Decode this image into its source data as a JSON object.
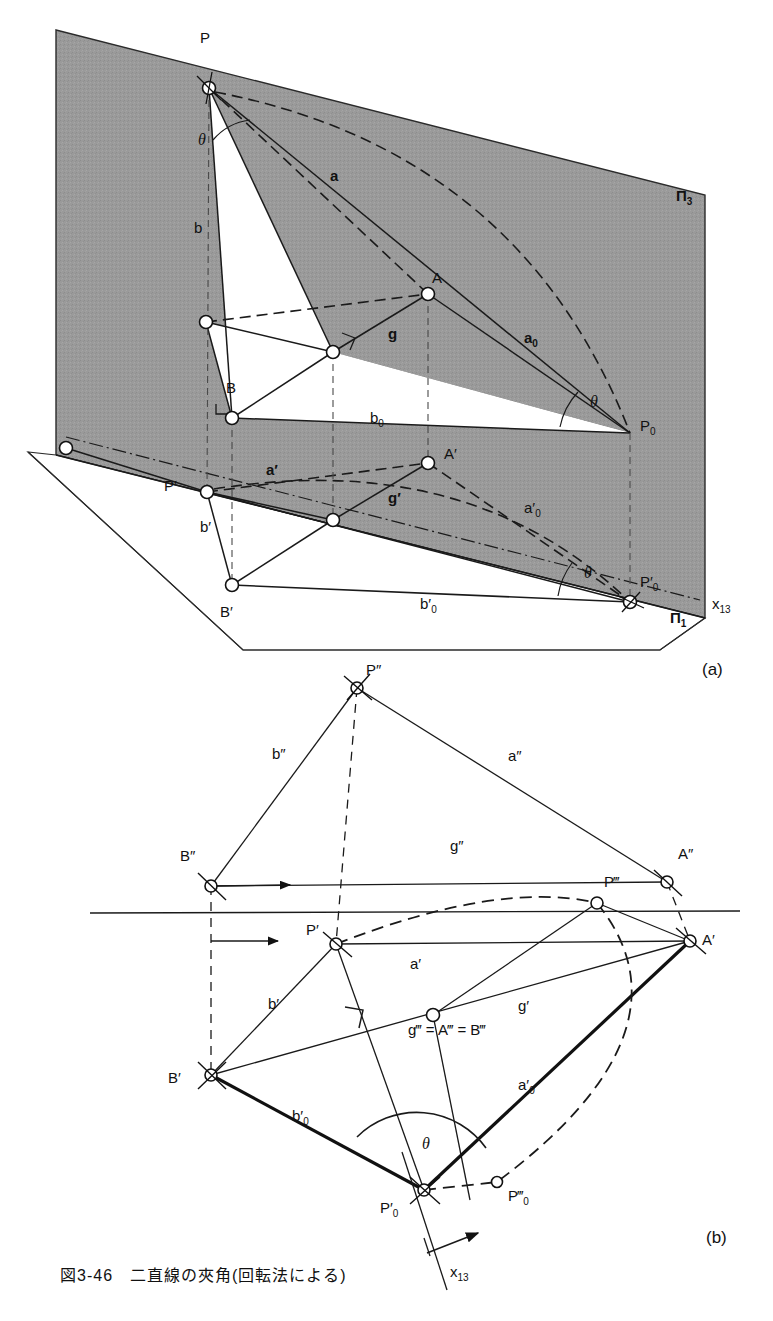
{
  "figure": {
    "caption": "図3-46　二直線の夾角(回転法による)",
    "panel_a_id": "(a)",
    "panel_b_id": "(b)",
    "colors": {
      "plane_fill": "#9a9a9a",
      "line": "#1a1a1a",
      "paper": "#ffffff"
    }
  },
  "panel_a": {
    "name": "pictorial-view",
    "plane_labels": [
      {
        "id": "pi3",
        "text": "Π",
        "sub": "3",
        "x": 678,
        "y": 196
      },
      {
        "id": "pi1",
        "text": "Π",
        "sub": "1",
        "x": 672,
        "y": 618
      },
      {
        "id": "x13",
        "text": "x",
        "sub": "13",
        "x": 714,
        "y": 604
      }
    ],
    "point_labels": [
      {
        "id": "P",
        "text": "P",
        "x": 200,
        "y": 38
      },
      {
        "id": "A",
        "text": "A",
        "x": 432,
        "y": 278
      },
      {
        "id": "B",
        "text": "B",
        "x": 228,
        "y": 388
      },
      {
        "id": "P0",
        "text": "P",
        "sup": "",
        "sub": "0",
        "x": 638,
        "y": 423
      },
      {
        "id": "Aq",
        "text": "A′",
        "x": 444,
        "y": 452
      },
      {
        "id": "Pq",
        "text": "P′",
        "x": 168,
        "y": 482
      },
      {
        "id": "Bq",
        "text": "B′",
        "x": 222,
        "y": 612
      },
      {
        "id": "P0q",
        "text": "P′",
        "sub": "0",
        "x": 640,
        "y": 582
      }
    ],
    "segment_labels": [
      {
        "id": "a",
        "text": "a",
        "x": 330,
        "y": 175
      },
      {
        "id": "b",
        "text": "b",
        "x": 196,
        "y": 228
      },
      {
        "id": "g",
        "text": "g",
        "x": 388,
        "y": 334
      },
      {
        "id": "a0",
        "text": "a",
        "sub": "0",
        "x": 525,
        "y": 338
      },
      {
        "id": "b0",
        "text": "b",
        "sub": "0",
        "x": 372,
        "y": 418
      },
      {
        "id": "aq",
        "text": "a′",
        "x": 268,
        "y": 470
      },
      {
        "id": "gq",
        "text": "g′",
        "x": 390,
        "y": 498
      },
      {
        "id": "a0q",
        "text": "a′",
        "sub": "0",
        "x": 525,
        "y": 508
      },
      {
        "id": "bq",
        "text": "b′",
        "x": 202,
        "y": 527
      },
      {
        "id": "b0q",
        "text": "b′",
        "sub": "0",
        "x": 422,
        "y": 604
      }
    ],
    "angle_labels": [
      {
        "id": "theta-top",
        "text": "θ",
        "x": 200,
        "y": 140
      },
      {
        "id": "theta-P0",
        "text": "θ",
        "x": 592,
        "y": 402
      },
      {
        "id": "theta-P0q",
        "text": "θ",
        "x": 586,
        "y": 573
      }
    ]
  },
  "panel_b": {
    "name": "orthographic-view",
    "point_labels": [
      {
        "id": "Pdd",
        "text": "P″",
        "x": 364,
        "y": 668
      },
      {
        "id": "Bdd",
        "text": "B″",
        "x": 184,
        "y": 855
      },
      {
        "id": "Add",
        "text": "A″",
        "x": 680,
        "y": 850
      },
      {
        "id": "Pddd",
        "text": "P‴",
        "x": 600,
        "y": 880
      },
      {
        "id": "Pq",
        "text": "P′",
        "x": 312,
        "y": 928
      },
      {
        "id": "Aq",
        "text": "A′",
        "x": 692,
        "y": 938
      },
      {
        "id": "Bq",
        "text": "B′",
        "x": 172,
        "y": 1078
      },
      {
        "id": "P0q",
        "text": "P′",
        "sub": "0",
        "x": 384,
        "y": 1212
      },
      {
        "id": "P0ddd",
        "text": "P‴",
        "sub": "0",
        "x": 508,
        "y": 1200
      }
    ],
    "segment_labels": [
      {
        "id": "bdd",
        "text": "b″",
        "x": 275,
        "y": 753
      },
      {
        "id": "add",
        "text": "a″",
        "x": 510,
        "y": 756
      },
      {
        "id": "gdd",
        "text": "g″",
        "x": 452,
        "y": 845
      },
      {
        "id": "aq",
        "text": "a′",
        "x": 412,
        "y": 963
      },
      {
        "id": "bq",
        "text": "b′",
        "x": 270,
        "y": 1003
      },
      {
        "id": "gq",
        "text": "g′",
        "x": 520,
        "y": 1005
      },
      {
        "id": "gddd",
        "text": "g‴ = A‴ = B‴",
        "x": 414,
        "y": 1029
      },
      {
        "id": "a0q",
        "text": "a′",
        "sub": "0",
        "x": 520,
        "y": 1085
      },
      {
        "id": "b0q",
        "text": "b′",
        "sub": "0",
        "x": 295,
        "y": 1116
      },
      {
        "id": "x13",
        "text": "x",
        "sub": "13",
        "x": 452,
        "y": 1272
      }
    ],
    "angle_labels": [
      {
        "id": "theta",
        "text": "θ",
        "x": 424,
        "y": 1145
      }
    ]
  }
}
